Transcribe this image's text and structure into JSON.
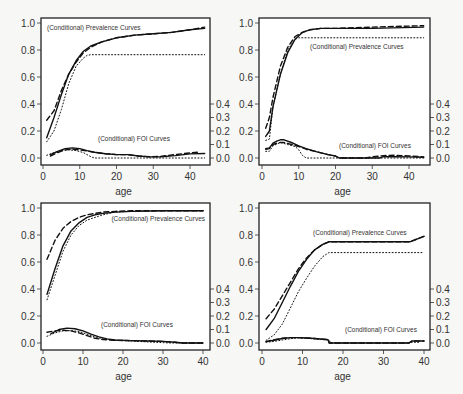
{
  "chart_data": [
    {
      "type": "line",
      "panel": "top-left",
      "xlabel": "age",
      "ylabel_left": "",
      "ylabel_right": "",
      "xlim": [
        0,
        44
      ],
      "ylim": [
        0,
        1.0
      ],
      "y2lim": [
        0,
        0.4
      ],
      "xticks": [
        0,
        10,
        20,
        30,
        40
      ],
      "yticks": [
        "0.0",
        "0.2",
        "0.4",
        "0.6",
        "0.8",
        "1.0"
      ],
      "y2ticks": [
        "0.0",
        "0.1",
        "0.2",
        "0.3",
        "0.4"
      ],
      "annotations": [
        "(Conditional) Prevalence Curves",
        "(Conditional) FOI Curves"
      ],
      "series": [
        {
          "name": "prevalence-solid",
          "style": "solid",
          "x": [
            1,
            3,
            5,
            7,
            9,
            11,
            13,
            16,
            20,
            25,
            30,
            35,
            40,
            44
          ],
          "y": [
            0.15,
            0.3,
            0.47,
            0.62,
            0.72,
            0.79,
            0.83,
            0.86,
            0.89,
            0.91,
            0.92,
            0.93,
            0.95,
            0.96
          ]
        },
        {
          "name": "prevalence-dashed",
          "style": "dashed",
          "x": [
            1,
            3,
            5,
            7,
            9,
            11,
            13,
            16,
            20,
            25,
            30,
            35,
            40,
            44
          ],
          "y": [
            0.28,
            0.35,
            0.5,
            0.62,
            0.71,
            0.78,
            0.82,
            0.86,
            0.89,
            0.91,
            0.92,
            0.93,
            0.95,
            0.97
          ]
        },
        {
          "name": "prevalence-dotted",
          "style": "dotted",
          "x": [
            1,
            3,
            5,
            7,
            9,
            11,
            12,
            13,
            44
          ],
          "y": [
            0.12,
            0.2,
            0.36,
            0.55,
            0.68,
            0.74,
            0.76,
            0.765,
            0.765
          ]
        },
        {
          "name": "foi-solid",
          "style": "solid",
          "x": [
            2,
            4,
            6,
            8,
            10,
            12,
            14,
            17,
            20,
            23,
            26,
            29,
            32,
            36,
            40,
            44
          ],
          "y": [
            0.025,
            0.05,
            0.07,
            0.075,
            0.07,
            0.055,
            0.042,
            0.032,
            0.025,
            0.025,
            0.015,
            0.008,
            0.01,
            0.018,
            0.03,
            0.033
          ]
        },
        {
          "name": "foi-dashed",
          "style": "dashed",
          "x": [
            2,
            4,
            6,
            8,
            10,
            12,
            14,
            17,
            20,
            23,
            26,
            29,
            32,
            36,
            40,
            42
          ],
          "y": [
            0.015,
            0.04,
            0.06,
            0.065,
            0.06,
            0.052,
            0.042,
            0.032,
            0.025,
            0.025,
            0.015,
            0.01,
            0.012,
            0.025,
            0.038,
            0.042
          ]
        },
        {
          "name": "foi-dotted",
          "style": "dotted",
          "x": [
            1,
            3,
            5,
            7,
            9,
            11,
            13,
            14,
            44
          ],
          "y": [
            0.02,
            0.04,
            0.055,
            0.06,
            0.055,
            0.04,
            0.01,
            0.0,
            0.0
          ]
        }
      ]
    },
    {
      "type": "line",
      "panel": "top-right",
      "xlabel": "age",
      "xlim": [
        0,
        44
      ],
      "ylim": [
        0,
        1.0
      ],
      "y2lim": [
        0,
        0.4
      ],
      "xticks": [
        0,
        10,
        20,
        30,
        40
      ],
      "yticks": [
        "0.0",
        "0.2",
        "0.4",
        "0.6",
        "0.8",
        "1.0"
      ],
      "y2ticks": [
        "0.0",
        "0.1",
        "0.2",
        "0.3",
        "0.4"
      ],
      "annotations": [
        "(Conditional) Prevalence Curves",
        "(Conditional) FOI Curves"
      ],
      "series": [
        {
          "name": "prevalence-solid",
          "style": "solid",
          "x": [
            1,
            2,
            3,
            5,
            7,
            9,
            11,
            13,
            16,
            20,
            30,
            44
          ],
          "y": [
            0.16,
            0.2,
            0.38,
            0.62,
            0.78,
            0.88,
            0.93,
            0.95,
            0.96,
            0.96,
            0.96,
            0.97
          ]
        },
        {
          "name": "prevalence-dashed",
          "style": "dashed",
          "x": [
            1,
            2,
            3,
            5,
            7,
            9,
            11,
            13,
            16,
            20,
            30,
            44
          ],
          "y": [
            0.22,
            0.3,
            0.45,
            0.68,
            0.82,
            0.9,
            0.93,
            0.95,
            0.96,
            0.96,
            0.97,
            0.98
          ]
        },
        {
          "name": "prevalence-dotted",
          "style": "dotted",
          "x": [
            1,
            2,
            3,
            5,
            7,
            9,
            10,
            44
          ],
          "y": [
            0.13,
            0.14,
            0.38,
            0.62,
            0.8,
            0.88,
            0.89,
            0.89
          ]
        },
        {
          "name": "foi-solid",
          "style": "solid",
          "x": [
            1,
            2,
            3,
            4,
            5,
            6,
            8,
            10,
            12,
            15,
            18,
            20,
            21,
            28,
            32,
            33,
            36,
            40,
            44
          ],
          "y": [
            0.07,
            0.075,
            0.11,
            0.125,
            0.135,
            0.135,
            0.115,
            0.09,
            0.07,
            0.045,
            0.025,
            0.015,
            0.0,
            0.0,
            0.0,
            0.01,
            0.01,
            0.008,
            0.005
          ]
        },
        {
          "name": "foi-dashed",
          "style": "dashed",
          "x": [
            1,
            2,
            3,
            4,
            5,
            6,
            8,
            10,
            12,
            15,
            18,
            20,
            21,
            28,
            30,
            33,
            36,
            40,
            44
          ],
          "y": [
            0.065,
            0.07,
            0.1,
            0.11,
            0.115,
            0.115,
            0.1,
            0.085,
            0.065,
            0.045,
            0.025,
            0.015,
            0.0,
            0.0,
            0.008,
            0.018,
            0.02,
            0.015,
            0.008
          ]
        },
        {
          "name": "foi-dotted",
          "style": "dotted",
          "x": [
            1,
            2,
            3,
            5,
            7,
            9,
            10,
            11,
            12,
            44
          ],
          "y": [
            0.05,
            0.05,
            0.09,
            0.115,
            0.1,
            0.085,
            0.06,
            0.02,
            0.0,
            0.0
          ]
        }
      ]
    },
    {
      "type": "line",
      "panel": "bottom-left",
      "xlabel": "age",
      "xlim": [
        0,
        40
      ],
      "ylim": [
        0,
        1.0
      ],
      "y2lim": [
        0,
        0.4
      ],
      "xticks": [
        0,
        10,
        20,
        30,
        40
      ],
      "yticks": [
        "0.0",
        "0.2",
        "0.4",
        "0.6",
        "0.8",
        "1.0"
      ],
      "y2ticks": [
        "0.0",
        "0.1",
        "0.2",
        "0.3",
        "0.4"
      ],
      "annotations": [
        "(Conditional) Prevalence Curves",
        "(Conditional) FOI Curves"
      ],
      "series": [
        {
          "name": "prevalence-solid",
          "style": "solid",
          "x": [
            1,
            3,
            5,
            7,
            9,
            11,
            13,
            15,
            18,
            22,
            30,
            40
          ],
          "y": [
            0.36,
            0.55,
            0.72,
            0.83,
            0.89,
            0.93,
            0.95,
            0.96,
            0.97,
            0.975,
            0.98,
            0.98
          ]
        },
        {
          "name": "prevalence-dashed",
          "style": "dashed",
          "x": [
            1,
            3,
            5,
            7,
            9,
            11,
            13,
            15,
            18,
            22,
            30,
            40
          ],
          "y": [
            0.62,
            0.76,
            0.85,
            0.9,
            0.93,
            0.95,
            0.96,
            0.97,
            0.975,
            0.98,
            0.98,
            0.98
          ]
        },
        {
          "name": "prevalence-dotted",
          "style": "dotted",
          "x": [
            1,
            3,
            5,
            7,
            9,
            11,
            13,
            15,
            18,
            22,
            30,
            40
          ],
          "y": [
            0.32,
            0.5,
            0.68,
            0.8,
            0.87,
            0.91,
            0.93,
            0.95,
            0.97,
            0.975,
            0.98,
            0.98
          ]
        },
        {
          "name": "foi-solid",
          "style": "solid",
          "x": [
            2,
            4,
            6,
            8,
            10,
            12,
            14,
            16,
            18,
            22,
            26,
            30,
            33,
            35,
            40
          ],
          "y": [
            0.07,
            0.1,
            0.11,
            0.105,
            0.09,
            0.065,
            0.045,
            0.03,
            0.022,
            0.018,
            0.015,
            0.012,
            0.005,
            0.0,
            0.0
          ]
        },
        {
          "name": "foi-dashed",
          "style": "dashed",
          "x": [
            1,
            3,
            5,
            7,
            9,
            11,
            13,
            15,
            18,
            22,
            26,
            30,
            33,
            35,
            40
          ],
          "y": [
            0.08,
            0.09,
            0.095,
            0.09,
            0.075,
            0.055,
            0.035,
            0.025,
            0.02,
            0.018,
            0.015,
            0.012,
            0.005,
            0.0,
            0.0
          ]
        },
        {
          "name": "foi-dotted",
          "style": "dotted",
          "x": [
            1,
            3,
            5,
            7,
            9,
            11,
            13,
            15,
            18,
            22,
            28,
            32,
            35,
            40
          ],
          "y": [
            0.05,
            0.075,
            0.09,
            0.092,
            0.085,
            0.065,
            0.045,
            0.03,
            0.02,
            0.015,
            0.005,
            0.0,
            0.0,
            0.0
          ]
        }
      ]
    },
    {
      "type": "line",
      "panel": "bottom-right",
      "xlabel": "age",
      "xlim": [
        0,
        40
      ],
      "ylim": [
        0,
        1.0
      ],
      "y2lim": [
        0,
        0.4
      ],
      "xticks": [
        0,
        10,
        20,
        30,
        40
      ],
      "yticks": [
        "0.0",
        "0.2",
        "0.4",
        "0.6",
        "0.8",
        "1.0"
      ],
      "y2ticks": [
        "0.0",
        "0.1",
        "0.2",
        "0.3",
        "0.4"
      ],
      "annotations": [
        "(Conditional) Prevalence Curves",
        "(Conditional) FOI Curves"
      ],
      "series": [
        {
          "name": "prevalence-solid",
          "style": "solid",
          "x": [
            1,
            3,
            5,
            7,
            9,
            11,
            13,
            15,
            16.5,
            36.5,
            40
          ],
          "y": [
            0.1,
            0.18,
            0.3,
            0.42,
            0.53,
            0.62,
            0.69,
            0.73,
            0.75,
            0.75,
            0.79
          ]
        },
        {
          "name": "prevalence-dashed",
          "style": "dashed",
          "x": [
            1,
            3,
            5,
            7,
            9,
            11,
            13,
            15,
            16.5,
            36.5,
            40
          ],
          "y": [
            0.18,
            0.25,
            0.35,
            0.45,
            0.55,
            0.63,
            0.69,
            0.73,
            0.75,
            0.75,
            0.79
          ]
        },
        {
          "name": "prevalence-dotted",
          "style": "dotted",
          "x": [
            1,
            3,
            5,
            7,
            9,
            11,
            13,
            15,
            16.5,
            40
          ],
          "y": [
            0.02,
            0.06,
            0.14,
            0.26,
            0.38,
            0.48,
            0.57,
            0.64,
            0.67,
            0.67
          ]
        },
        {
          "name": "foi-solid",
          "style": "solid",
          "x": [
            1,
            3,
            5,
            7,
            9,
            11,
            13,
            15,
            16.3,
            16.6,
            36.3,
            37,
            40
          ],
          "y": [
            0.01,
            0.02,
            0.033,
            0.04,
            0.04,
            0.037,
            0.033,
            0.028,
            0.025,
            0.0,
            0.0,
            0.015,
            0.015
          ]
        },
        {
          "name": "foi-dashed",
          "style": "dashed",
          "x": [
            1,
            3,
            5,
            7,
            9,
            11,
            13,
            15,
            16.3,
            16.6,
            36.3,
            37,
            40
          ],
          "y": [
            0.01,
            0.025,
            0.035,
            0.04,
            0.04,
            0.037,
            0.033,
            0.028,
            0.025,
            0.0,
            0.0,
            0.015,
            0.015
          ]
        },
        {
          "name": "foi-dotted",
          "style": "dotted",
          "x": [
            1,
            3,
            5,
            7,
            9,
            11,
            13,
            15,
            16.5,
            17,
            36.5,
            37,
            39
          ],
          "y": [
            0.005,
            0.012,
            0.022,
            0.032,
            0.038,
            0.035,
            0.03,
            0.025,
            0.022,
            0.0,
            0.0,
            0.005,
            0.005
          ]
        }
      ]
    }
  ],
  "labels": {
    "xlabel": "age",
    "prevalence_annotation": "(Conditional) Prevalence Curves",
    "foi_annotation": "(Conditional) FOI Curves"
  }
}
